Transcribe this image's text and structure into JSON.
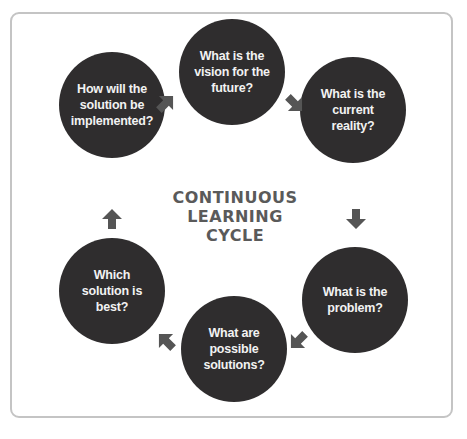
{
  "diagram": {
    "title_lines": [
      "CONTINUOUS",
      "LEARNING",
      "CYCLE"
    ],
    "nodes": [
      {
        "id": "vision",
        "label": "What is the vision for the future?"
      },
      {
        "id": "reality",
        "label": "What is the current reality?"
      },
      {
        "id": "problem",
        "label": "What is the problem?"
      },
      {
        "id": "solutions",
        "label": "What are possible solutions?"
      },
      {
        "id": "best",
        "label": "Which solution is best?"
      },
      {
        "id": "implement",
        "label": "How will the solution be implemented?"
      }
    ],
    "flow": [
      "vision",
      "reality",
      "problem",
      "solutions",
      "best",
      "implement",
      "vision"
    ],
    "colors": {
      "node_fill": "#2f2d2e",
      "node_text": "#f2f2f2",
      "arrow": "#555555",
      "title": "#5a5a5a",
      "frame": "#c4c4c4"
    }
  }
}
